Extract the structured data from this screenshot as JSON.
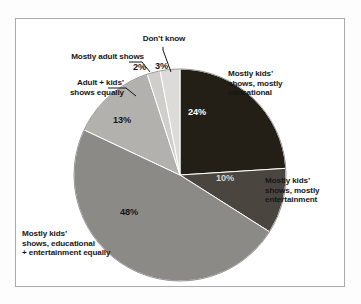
{
  "chart_data": {
    "type": "pie",
    "title": "",
    "subtitle": "",
    "xlabel": "",
    "ylabel": "",
    "legend_position": "none",
    "grid": false,
    "start_angle_deg": 0,
    "direction": "clockwise",
    "categories": [
      "Mostly kids’ shows, mostly educational",
      "Mostly kids’ shows, mostly entertainment",
      "Mostly kids’ shows, educational + entertainment equally",
      "Adult + kids’ shows equally",
      "Mostly adult shows",
      "Don’t know"
    ],
    "values": [
      24,
      10,
      48,
      13,
      2,
      3
    ],
    "value_labels": [
      "24%",
      "10%",
      "48%",
      "13%",
      "2%",
      "3%"
    ],
    "colors": [
      "#231f16",
      "#4a463f",
      "#8c8a86",
      "#b3b1ad",
      "#cfcecb",
      "#dcdbd8"
    ],
    "slices": [
      {
        "label": "Mostly kids’ shows, mostly educational",
        "label_lines": "Mostly kids’\nshows, mostly\neducational",
        "value": 24,
        "value_label": "24%",
        "color": "#231f16",
        "label_placement": "right-outside",
        "leader_line": false
      },
      {
        "label": "Mostly kids’ shows, mostly entertainment",
        "label_lines": "Mostly kids’\nshows, mostly\nentertainment",
        "value": 10,
        "value_label": "10%",
        "color": "#4a463f",
        "label_placement": "right-outside",
        "leader_line": false
      },
      {
        "label": "Mostly kids’ shows, educational + entertainment equally",
        "label_lines": "Mostly kids’\nshows, educational\n+ entertainment equally",
        "value": 48,
        "value_label": "48%",
        "color": "#8c8a86",
        "label_placement": "bottom-left-outside",
        "leader_line": false
      },
      {
        "label": "Adult + kids’ shows equally",
        "label_lines": "Adult + kids’\nshows equally",
        "value": 13,
        "value_label": "13%",
        "color": "#b3b1ad",
        "label_placement": "left-outside",
        "leader_line": true
      },
      {
        "label": "Mostly adult shows",
        "label_lines": "Mostly adult shows",
        "value": 2,
        "value_label": "2%",
        "color": "#cfcecb",
        "label_placement": "top-left-outside",
        "leader_line": true
      },
      {
        "label": "Don’t know",
        "label_lines": "Don’t know",
        "value": 3,
        "value_label": "3%",
        "color": "#dcdbd8",
        "label_placement": "top-outside",
        "leader_line": true
      }
    ],
    "total": 100,
    "units": "percent"
  },
  "figure": {
    "frame_color": "#a9a9ae",
    "background": "#ffffff"
  }
}
